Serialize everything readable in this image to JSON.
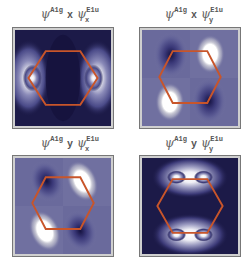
{
  "panels": [
    {
      "id": "a1g-x-e1u-x",
      "label": {
        "psi1": "ψ",
        "sup1": "A1g",
        "op": "x",
        "psi2": "ψ",
        "sup2": "E1u",
        "sub2": "x"
      }
    },
    {
      "id": "a1g-x-e1u-y",
      "label": {
        "psi1": "ψ",
        "sup1": "A1g",
        "op": "x",
        "psi2": "ψ",
        "sup2": "E1u",
        "sub2": "y"
      }
    },
    {
      "id": "a1g-y-e1u-x",
      "label": {
        "psi1": "ψ",
        "sup1": "A1g",
        "op": "y",
        "psi2": "ψ",
        "sup2": "E1u",
        "sub2": "x"
      }
    },
    {
      "id": "a1g-y-e1u-y",
      "label": {
        "psi1": "ψ",
        "sup1": "A1g",
        "op": "y",
        "psi2": "ψ",
        "sup2": "E1u",
        "sub2": "y"
      }
    }
  ],
  "colors": {
    "background_dark": "#1c1a48",
    "background_mid": "#7070a0",
    "hexagon": "#c8552a",
    "lobe_bright": "#ffffff"
  }
}
